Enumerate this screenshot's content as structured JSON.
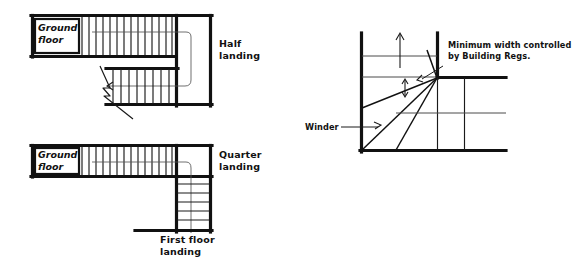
{
  "figure": {
    "background_color": "#ffffff",
    "ink_color": "#111111"
  },
  "diagrams": [
    {
      "id": "half-landing-plan",
      "name": "Half landing stair plan",
      "labels": {
        "ground_floor": "Ground\nfloor",
        "ground_floor_line1": "Ground",
        "ground_floor_line2": "floor",
        "landing_line1": "Half",
        "landing_line2": "landing"
      },
      "upper_flight_risers": 13,
      "lower_flight_risers": 7,
      "has_break_line": true,
      "direction_arrow": "left"
    },
    {
      "id": "quarter-landing-plan",
      "name": "Quarter landing stair plan",
      "labels": {
        "ground_floor_line1": "Ground",
        "ground_floor_line2": "floor",
        "landing_line1": "Quarter",
        "landing_line2": "landing",
        "first_floor_line1": "First floor",
        "first_floor_line2": "landing"
      },
      "upper_flight_risers": 13,
      "lower_flight_risers": 5
    },
    {
      "id": "winder-plan",
      "name": "Winder tread plan",
      "labels": {
        "winder": "Winder",
        "note_line1": "Minimum width controlled",
        "note_line2": "by Building Regs."
      },
      "winder_tread_count": 4,
      "straight_tread_count": 2,
      "has_dimension_arrow": true,
      "has_up_arrow": true
    }
  ]
}
